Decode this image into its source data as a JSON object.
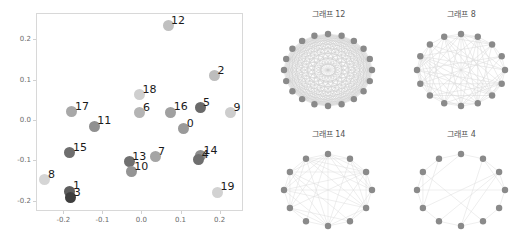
{
  "chart_data": [
    {
      "type": "scatter",
      "title": "",
      "xlabel": "",
      "ylabel": "",
      "xlim": [
        -0.27,
        0.26
      ],
      "ylim": [
        -0.225,
        0.265
      ],
      "xticks": [
        "-0.2",
        "-0.1",
        "0.0",
        "0.1",
        "0.2"
      ],
      "xtick_values": [
        -0.2,
        -0.1,
        0.0,
        0.1,
        0.2
      ],
      "yticks": [
        "0.2",
        "0.1",
        "0.0",
        "-0.1",
        "-0.2"
      ],
      "ytick_values": [
        0.2,
        0.1,
        0.0,
        -0.1,
        -0.2
      ],
      "grid": false,
      "legend": "none",
      "point_label_field": "label",
      "points": [
        {
          "label": "12",
          "x": 0.068,
          "y": 0.234,
          "shade": "#c0c0c0"
        },
        {
          "label": "2",
          "x": 0.187,
          "y": 0.11,
          "shade": "#bdbdbd"
        },
        {
          "label": "18",
          "x": -0.005,
          "y": 0.063,
          "shade": "#cfcfcf"
        },
        {
          "label": "17",
          "x": -0.178,
          "y": 0.021,
          "shade": "#a8a8a8"
        },
        {
          "label": "6",
          "x": -0.004,
          "y": 0.018,
          "shade": "#b4b4b4"
        },
        {
          "label": "16",
          "x": 0.075,
          "y": 0.019,
          "shade": "#a0a0a0"
        },
        {
          "label": "5",
          "x": 0.15,
          "y": 0.031,
          "shade": "#6a6a6a"
        },
        {
          "label": "9",
          "x": 0.228,
          "y": 0.018,
          "shade": "#cdcdcd"
        },
        {
          "label": "11",
          "x": -0.121,
          "y": -0.015,
          "shade": "#909090"
        },
        {
          "label": "0",
          "x": 0.108,
          "y": -0.022,
          "shade": "#9a9a9a"
        },
        {
          "label": "15",
          "x": -0.183,
          "y": -0.081,
          "shade": "#6e6e6e"
        },
        {
          "label": "13",
          "x": -0.031,
          "y": -0.103,
          "shade": "#707070"
        },
        {
          "label": "7",
          "x": 0.035,
          "y": -0.091,
          "shade": "#a5a5a5"
        },
        {
          "label": "10",
          "x": -0.026,
          "y": -0.128,
          "shade": "#949494"
        },
        {
          "label": "14",
          "x": 0.151,
          "y": -0.088,
          "shade": "#8d8d8d"
        },
        {
          "label": "4",
          "x": 0.147,
          "y": -0.098,
          "shade": "#6f6f6f"
        },
        {
          "label": "8",
          "x": -0.247,
          "y": -0.148,
          "shade": "#d5d5d5"
        },
        {
          "label": "1",
          "x": -0.183,
          "y": -0.176,
          "shade": "#5e5e5e"
        },
        {
          "label": "3",
          "x": -0.181,
          "y": -0.192,
          "shade": "#3f3f3f"
        },
        {
          "label": "19",
          "x": 0.195,
          "y": -0.178,
          "shade": "#d2d2d2"
        }
      ]
    },
    {
      "type": "diagram",
      "title": "그래프 12",
      "layout": "circular",
      "nodes": 20,
      "edge_density": 1.0,
      "node_color": "#8a8a8a",
      "edge_color": "#cfcfcf"
    },
    {
      "type": "diagram",
      "title": "그래프 8",
      "layout": "circular",
      "nodes": 16,
      "edge_density": 0.55,
      "node_color": "#8a8a8a",
      "edge_color": "#d8d8d8"
    },
    {
      "type": "diagram",
      "title": "그래프 14",
      "layout": "circular",
      "nodes": 12,
      "edge_density": 0.62,
      "node_color": "#8a8a8a",
      "edge_color": "#dcdcdc"
    },
    {
      "type": "diagram",
      "title": "그래프 4",
      "layout": "circular",
      "nodes": 12,
      "edge_density": 0.2,
      "node_color": "#8a8a8a",
      "edge_color": "#dcdcdc"
    }
  ],
  "graphs": {
    "top_left": {
      "title": "그래프 12"
    },
    "top_right": {
      "title": "그래프 8"
    },
    "bottom_left": {
      "title": "그래프 14"
    },
    "bottom_right": {
      "title": "그래프 4"
    }
  }
}
